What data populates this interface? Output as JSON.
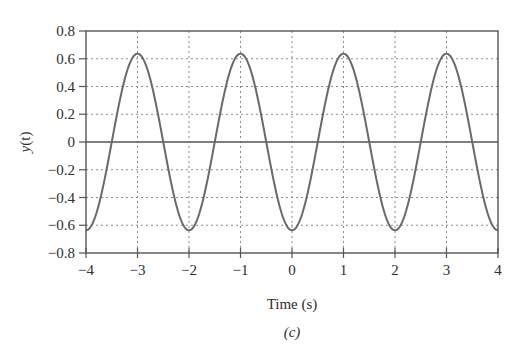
{
  "figure": {
    "caption": "(c)",
    "xlabel": "Time (s)",
    "ylabel_main": "y",
    "ylabel_arg": "(t)"
  },
  "chart_data": {
    "type": "line",
    "title": "",
    "xlabel": "Time (s)",
    "ylabel": "y(t)",
    "caption": "(c)",
    "xlim": [
      -4,
      4
    ],
    "ylim": [
      -0.8,
      0.8
    ],
    "xticks": [
      -4,
      -3,
      -2,
      -1,
      0,
      1,
      2,
      3,
      4
    ],
    "xtick_labels": [
      "−4",
      "−3",
      "−2",
      "−1",
      "0",
      "1",
      "2",
      "3",
      "4"
    ],
    "yticks": [
      0.8,
      0.6,
      0.4,
      0.2,
      0,
      -0.2,
      -0.4,
      -0.6,
      -0.8
    ],
    "ytick_labels": [
      "0.8",
      "0.6",
      "0.4",
      "0.2",
      "0",
      "−0.2",
      "−0.4",
      "−0.6",
      "−0.8"
    ],
    "grid": true,
    "legend": null,
    "series": [
      {
        "name": "y(t)",
        "description": "Periodic cosine-like signal, period 2 s, amplitude ~0.64 (2/pi); peaks at t = -3, -1, 1, 3; troughs at t = -4, -2, 0, 2, 4",
        "amplitude": 0.6366,
        "period": 2,
        "x": [
          -4,
          -3.5,
          -3,
          -2.5,
          -2,
          -1.5,
          -1,
          -0.5,
          0,
          0.5,
          1,
          1.5,
          2,
          2.5,
          3,
          3.5,
          4
        ],
        "y": [
          -0.64,
          0,
          0.64,
          0,
          -0.64,
          0,
          0.64,
          0,
          -0.64,
          0,
          0.64,
          0,
          -0.64,
          0,
          0.64,
          0,
          -0.64
        ]
      }
    ],
    "colors": {
      "curve": "#6a6a6a",
      "axes": "#555555",
      "grid": "#8a8a8a"
    }
  }
}
